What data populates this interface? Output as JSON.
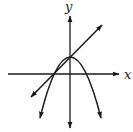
{
  "diagram": {
    "type": "coordinate-graph",
    "axes": {
      "x_label": "x",
      "y_label": "y"
    },
    "curves": [
      {
        "name": "downward-parabola",
        "description": "Parabola opening downward with vertex on the y-axis above origin"
      },
      {
        "name": "line",
        "description": "Line with positive slope intersecting the parabola at its vertex and at its left x-intercept"
      }
    ],
    "colors": {
      "stroke": "#1a1a1a",
      "background": "#ffffff"
    }
  }
}
